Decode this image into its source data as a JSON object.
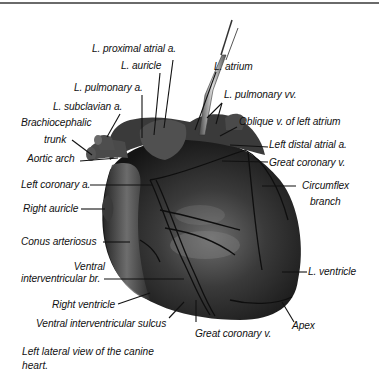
{
  "figure": {
    "title": "Left lateral view of the canine heart.",
    "caption": "Left lateral view of the canine heart.",
    "colors": {
      "heart_dark": "#1e1e1e",
      "heart_mid": "#3c3c3c",
      "heart_highlight": "#8a8a8a",
      "text": "#111111",
      "rule": "#6a6a6a"
    },
    "labels": {
      "l_proximal_atrial_a": "L. proximal atrial a.",
      "l_auricle": "L. auricle",
      "l_atrium": "L. atrium",
      "l_pulmonary_a": "L. pulmonary a.",
      "l_pulmonary_vv": "L. pulmonary vv.",
      "l_subclavian_a": "L. subclavian a.",
      "brachiocephalic_1": "Brachiocephalic",
      "brachiocephalic_2": "trunk",
      "oblique_v": "Oblique v. of left atrium",
      "left_distal_atrial_a": "Left distal atrial a.",
      "aortic_arch": "Aortic arch",
      "great_coronary_v_top": "Great coronary v.",
      "left_coronary_a": "Left coronary a.",
      "circumflex_1": "Circumflex",
      "circumflex_2": "branch",
      "right_auricle": "Right auricle",
      "conus_arteriosus": "Conus arteriosus",
      "ventral_ivb_1": "Ventral",
      "ventral_ivb_2": "interventricular br.",
      "l_ventricle": "L. ventricle",
      "right_ventricle": "Right ventricle",
      "apex": "Apex",
      "ventral_iv_sulcus": "Ventral interventricular sulcus",
      "great_coronary_v_bottom": "Great coronary v."
    }
  }
}
